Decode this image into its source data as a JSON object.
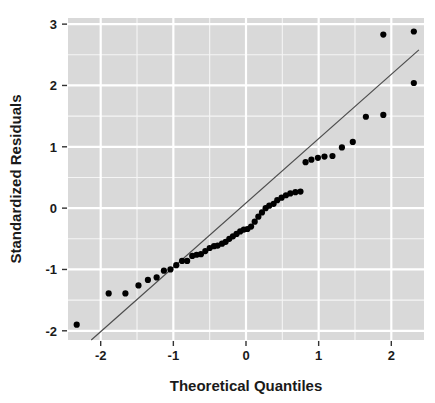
{
  "chart_data": {
    "type": "scatter",
    "title": "",
    "subtitle": "",
    "xlabel": "Theoretical Quantiles",
    "ylabel": "Standardized Residuals",
    "xlim": [
      -2.45,
      2.45
    ],
    "ylim": [
      -2.15,
      3.1
    ],
    "xticks": [
      -2,
      -1,
      0,
      1,
      2
    ],
    "xticklabels": [
      "-2",
      "-1",
      "0",
      "1",
      "2"
    ],
    "yticks": [
      -2,
      -1,
      0,
      1,
      2,
      3
    ],
    "yticklabels": [
      "-2",
      "-1",
      "0",
      "1",
      "2",
      "3"
    ],
    "grid": true,
    "grid_major_color": "#ffffff",
    "grid_minor_color": "#f5f5f5",
    "panel_background": "#d9d9d9",
    "point_color": "#000000",
    "point_size": 4.2,
    "legend": "none",
    "legend_position": "none",
    "annotations": [],
    "series": [
      {
        "name": "Standardized residuals",
        "type": "scatter",
        "x": [
          -2.33,
          -1.89,
          -1.66,
          -1.48,
          -1.35,
          -1.23,
          -1.13,
          -1.04,
          -0.96,
          -0.88,
          -0.81,
          -0.74,
          -0.68,
          -0.62,
          -0.56,
          -0.5,
          -0.44,
          -0.39,
          -0.33,
          -0.28,
          -0.23,
          -0.18,
          -0.13,
          -0.08,
          -0.03,
          0.02,
          0.07,
          0.12,
          0.17,
          0.22,
          0.27,
          0.32,
          0.38,
          0.43,
          0.49,
          0.55,
          0.61,
          0.68,
          0.75,
          0.82,
          0.9,
          0.99,
          1.08,
          1.19,
          1.32,
          1.47,
          1.65,
          1.89,
          2.31
        ],
        "y": [
          -1.9,
          -1.39,
          -1.39,
          -1.26,
          -1.17,
          -1.13,
          -1.02,
          -1.0,
          -0.93,
          -0.86,
          -0.86,
          -0.78,
          -0.76,
          -0.75,
          -0.7,
          -0.65,
          -0.62,
          -0.61,
          -0.58,
          -0.55,
          -0.5,
          -0.46,
          -0.42,
          -0.38,
          -0.35,
          -0.34,
          -0.3,
          -0.22,
          -0.14,
          -0.07,
          0.0,
          0.04,
          0.07,
          0.13,
          0.17,
          0.21,
          0.24,
          0.26,
          0.27,
          0.75,
          0.79,
          0.82,
          0.84,
          0.85,
          0.99,
          1.08,
          1.49,
          1.52,
          2.04
        ]
      }
    ],
    "reference_line": {
      "name": "qq-reference-line",
      "type": "line",
      "color": "#4d4d4d",
      "width": 1.2,
      "x": [
        -2.13,
        2.38
      ],
      "y": [
        -2.15,
        2.58
      ]
    },
    "outlier_points": {
      "x": [
        1.89,
        2.31
      ],
      "y": [
        2.83,
        2.88
      ]
    }
  }
}
